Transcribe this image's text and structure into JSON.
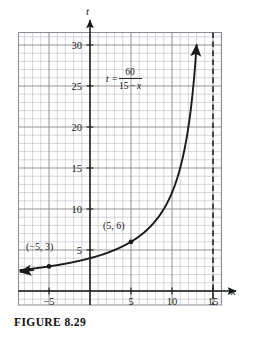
{
  "figure": {
    "caption": "FIGURE 8.29"
  },
  "chart_data": {
    "type": "line",
    "title": "",
    "equation": {
      "lhs": "t",
      "equals": "=",
      "numerator": "60",
      "denominator_a": "15",
      "denominator_minus": "−",
      "denominator_b": "x",
      "plain": "t = 60/(15 − x)"
    },
    "xlabel": "x",
    "ylabel": "t",
    "xlim": [
      -8.8,
      16.1
    ],
    "ylim": [
      -1.7,
      33.3
    ],
    "xticks": [
      -5,
      5,
      10,
      15
    ],
    "xticklabels": [
      "−5",
      "5",
      "10",
      "15"
    ],
    "yticks": [
      5,
      10,
      15,
      20,
      25,
      30
    ],
    "yticklabels": [
      "5",
      "10",
      "15",
      "20",
      "25",
      "30"
    ],
    "grid": true,
    "grid_minor_step": 1,
    "grid_major_step": 5,
    "legend": "none",
    "asymptote": {
      "type": "vertical",
      "x": 15,
      "style": "dashed",
      "label": ""
    },
    "curve": {
      "name": "t = 60/(15 - x)",
      "x_start": -8.5,
      "x_end": 13.0,
      "arrow_start": true,
      "arrow_end": true,
      "points_sample": [
        {
          "x": -8.5,
          "y": 2.55
        },
        {
          "x": -5,
          "y": 3
        },
        {
          "x": 0,
          "y": 4
        },
        {
          "x": 5,
          "y": 6
        },
        {
          "x": 7.5,
          "y": 8
        },
        {
          "x": 10,
          "y": 12
        },
        {
          "x": 11.5,
          "y": 17.14
        },
        {
          "x": 12.5,
          "y": 24
        },
        {
          "x": 13,
          "y": 30
        }
      ]
    },
    "marked_points": [
      {
        "x": -5,
        "y": 3,
        "label": "(−5, 3)"
      },
      {
        "x": 5,
        "y": 6,
        "label": "(5, 6)"
      }
    ],
    "colors": {
      "curve": "#1a1a1a",
      "axis": "#1a1a1a",
      "grid_minor": "#b9b9c4",
      "grid_major": "#8a8a96",
      "background": "#ffffff",
      "asymptote": "#1a1a1a"
    }
  }
}
